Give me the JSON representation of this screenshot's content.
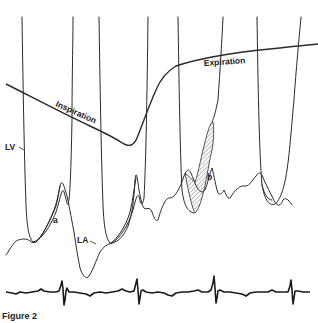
{
  "figure": {
    "caption": "Figure 2",
    "labels": {
      "lv": "LV",
      "la": "LA",
      "a": "a",
      "b": "b",
      "inspiration": "Inspiration",
      "expiration": "Expiration"
    },
    "colors": {
      "trace": "#2a2a2a",
      "background": "#ffffff",
      "hatch": "#555555"
    },
    "traces": [
      {
        "name": "LV pressure",
        "description": "Left ventricular pressure, tall systolic upstrokes clipped at top"
      },
      {
        "name": "LA pressure",
        "description": "Left atrial pressure with a-wave and shaded area b"
      },
      {
        "name": "Respiration",
        "description": "Respiratory trace: falling during inspiration, rising during expiration"
      },
      {
        "name": "ECG",
        "description": "Electrocardiogram with 4 QRS complexes"
      }
    ],
    "ecg_qrs_count": 4,
    "lv_beats": 4
  }
}
